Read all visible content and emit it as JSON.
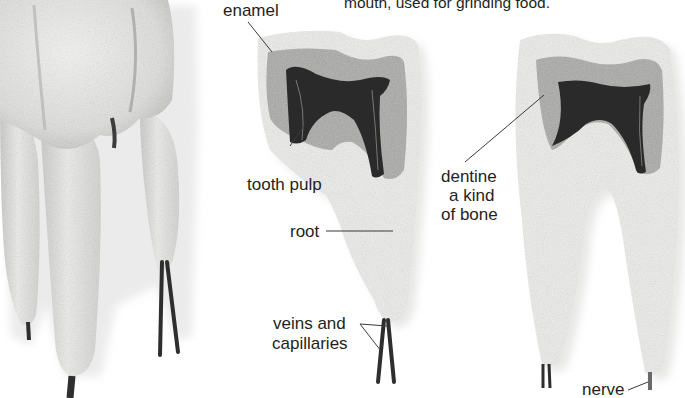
{
  "caption": {
    "text": "mouth, used for grinding food."
  },
  "labels": {
    "enamel": "enamel",
    "tooth_pulp": "tooth pulp",
    "root": "root",
    "dentine": "dentine",
    "dentine_desc_line1": "a kind",
    "dentine_desc_line2": "of bone",
    "veins_line1": "veins and",
    "veins_line2": "capillaries",
    "nerve": "nerve"
  },
  "figures": [
    {
      "id": "whole-molar",
      "description": "Whole molar model, exterior view, with three roots and nerve/vessel strands"
    },
    {
      "id": "molar-cross-section-left",
      "description": "Cut-away molar showing enamel, dentine and dark pulp chamber"
    },
    {
      "id": "molar-cross-section-right",
      "description": "Cut-away molar with two roots showing dentine and pulp"
    }
  ],
  "colors": {
    "background": "#ffffff",
    "tooth_surface": "#eeeeec",
    "tooth_shadow": "#bdbdbb",
    "dentine": "#a9a9a7",
    "pulp": "#2b2a2a",
    "nerve_strand": "#2e2e2e",
    "label_text": "#231f20",
    "leader_line": "#3a3a3a"
  }
}
